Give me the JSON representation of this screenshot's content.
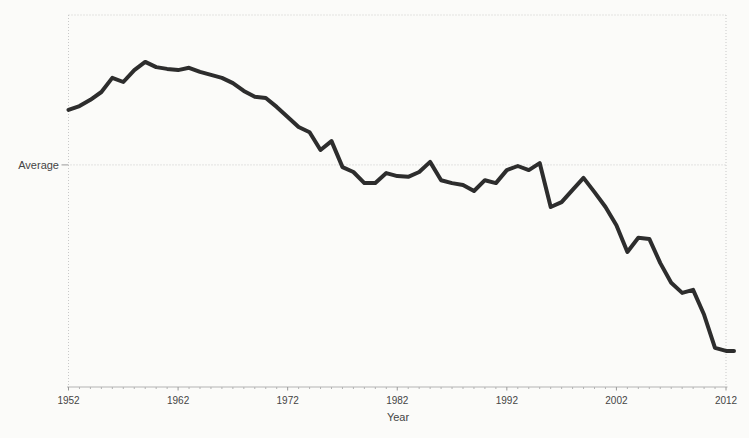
{
  "style": {
    "background": "#fbfbf9",
    "line_color": "#2d2d2d",
    "frame_color": "#c9c9c9",
    "axis_color": "#b3b3b3",
    "tick_color": "#9a9a9a",
    "text_color": "#454545"
  },
  "chart_data": {
    "type": "line",
    "title": "",
    "xlabel": "Year",
    "ylabel": "Average",
    "xlim": [
      1952,
      2012
    ],
    "ylim": [
      0,
      100
    ],
    "x_tick_years": [
      1952,
      1962,
      1972,
      1982,
      1992,
      2002,
      2012
    ],
    "x_tick_labels": [
      "1952",
      "1962",
      "1972",
      "1982",
      "1992",
      "2002",
      "2012"
    ],
    "average_gridline_value": 59.7,
    "grid": "dotted outer frame; single dotted horizontal gridline at the Average level; no legend; y axis has only the 'Average' tick",
    "legend_position": "none",
    "series": [
      {
        "name": "Average",
        "x": [
          1952,
          1953,
          1954,
          1955,
          1956,
          1957,
          1958,
          1959,
          1960,
          1961,
          1962,
          1963,
          1964,
          1965,
          1966,
          1967,
          1968,
          1969,
          1970,
          1971,
          1972,
          1973,
          1974,
          1975,
          1976,
          1977,
          1978,
          1979,
          1980,
          1981,
          1982,
          1983,
          1984,
          1985,
          1986,
          1987,
          1988,
          1989,
          1990,
          1991,
          1992,
          1993,
          1994,
          1995,
          1996,
          1997,
          1998,
          1999,
          2000,
          2001,
          2002,
          2003,
          2004,
          2005,
          2006,
          2007,
          2008,
          2009,
          2010,
          2011,
          2012
        ],
        "values": [
          74.5,
          75.5,
          77.2,
          79.3,
          83.1,
          82.0,
          85.2,
          87.4,
          86.0,
          85.5,
          85.2,
          85.8,
          84.7,
          83.9,
          83.1,
          81.7,
          79.6,
          78.0,
          77.7,
          75.3,
          72.6,
          69.9,
          68.5,
          63.7,
          66.1,
          59.1,
          57.8,
          54.8,
          54.8,
          57.5,
          56.7,
          56.5,
          57.8,
          60.5,
          55.6,
          54.8,
          54.3,
          52.7,
          55.6,
          54.8,
          58.3,
          59.4,
          58.3,
          60.2,
          48.4,
          49.7,
          53.0,
          56.2,
          52.4,
          48.4,
          43.5,
          36.3,
          40.1,
          39.8,
          33.3,
          28.0,
          25.3,
          26.1,
          19.4,
          10.5,
          9.7
        ]
      }
    ]
  }
}
